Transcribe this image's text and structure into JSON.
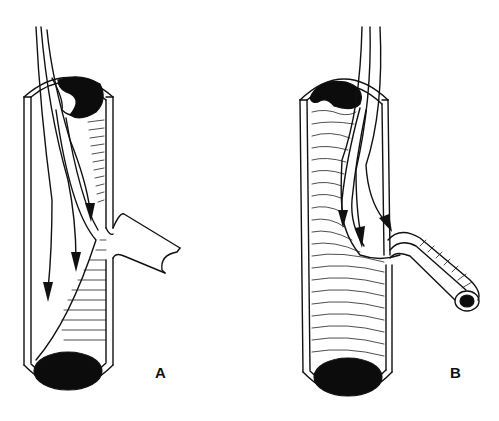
{
  "figure": {
    "panels": [
      {
        "id": "A",
        "label": "A",
        "description": "Vessel with intimal flap; flow arrows directed down main lumen, side branch occluded"
      },
      {
        "id": "B",
        "label": "B",
        "description": "Vessel with flow arrows directed into patent side branch"
      }
    ],
    "colors": {
      "line": "#111111",
      "background": "#ffffff",
      "lumen": "#0c0c0c"
    }
  }
}
